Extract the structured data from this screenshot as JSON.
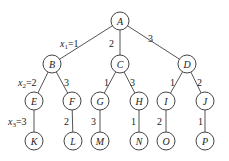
{
  "diagram": {
    "type": "tree",
    "nodes": [
      {
        "id": "A",
        "label": "A",
        "x": 120,
        "y": 21
      },
      {
        "id": "B",
        "label": "B",
        "x": 52,
        "y": 64
      },
      {
        "id": "C",
        "label": "C",
        "x": 120,
        "y": 64
      },
      {
        "id": "D",
        "label": "D",
        "x": 187,
        "y": 64
      },
      {
        "id": "E",
        "label": "E",
        "x": 34,
        "y": 101
      },
      {
        "id": "F",
        "label": "F",
        "x": 72,
        "y": 101
      },
      {
        "id": "G",
        "label": "G",
        "x": 100,
        "y": 101
      },
      {
        "id": "H",
        "label": "H",
        "x": 139,
        "y": 101
      },
      {
        "id": "I",
        "label": "I",
        "x": 166,
        "y": 101
      },
      {
        "id": "J",
        "label": "J",
        "x": 205,
        "y": 101
      },
      {
        "id": "K",
        "label": "K",
        "x": 34,
        "y": 141
      },
      {
        "id": "L",
        "label": "L",
        "x": 73,
        "y": 141
      },
      {
        "id": "M",
        "label": "M",
        "x": 100,
        "y": 141
      },
      {
        "id": "N",
        "label": "N",
        "x": 139,
        "y": 141
      },
      {
        "id": "O",
        "label": "O",
        "x": 166,
        "y": 141
      },
      {
        "id": "P",
        "label": "P",
        "x": 205,
        "y": 141
      }
    ],
    "edges": [
      {
        "from": "A",
        "to": "B",
        "label": "x1=1",
        "main": "x",
        "sub": "1",
        "tail": "=1",
        "lx": 60,
        "ly": 47
      },
      {
        "from": "A",
        "to": "C",
        "label": "2",
        "lx": 109,
        "ly": 47
      },
      {
        "from": "A",
        "to": "D",
        "label": "3",
        "lx": 148,
        "ly": 42
      },
      {
        "from": "B",
        "to": "E",
        "label": "x2=2",
        "main": "x",
        "sub": "2",
        "tail": "=2",
        "lx": 18,
        "ly": 86
      },
      {
        "from": "B",
        "to": "F",
        "label": "3",
        "lx": 64,
        "ly": 86
      },
      {
        "from": "C",
        "to": "G",
        "label": "1",
        "lx": 104,
        "ly": 86
      },
      {
        "from": "C",
        "to": "H",
        "label": "3",
        "lx": 130,
        "ly": 86
      },
      {
        "from": "D",
        "to": "I",
        "label": "1",
        "lx": 170,
        "ly": 86
      },
      {
        "from": "D",
        "to": "J",
        "label": "2",
        "lx": 197,
        "ly": 86
      },
      {
        "from": "E",
        "to": "K",
        "label": "x3=3",
        "main": "x",
        "sub": "3",
        "tail": "=3",
        "lx": 8,
        "ly": 125
      },
      {
        "from": "F",
        "to": "L",
        "label": "2",
        "lx": 64,
        "ly": 125
      },
      {
        "from": "G",
        "to": "M",
        "label": "3",
        "lx": 91,
        "ly": 125
      },
      {
        "from": "H",
        "to": "N",
        "label": "1",
        "lx": 131,
        "ly": 125
      },
      {
        "from": "I",
        "to": "O",
        "label": "2",
        "lx": 157,
        "ly": 125
      },
      {
        "from": "J",
        "to": "P",
        "label": "1",
        "lx": 198,
        "ly": 125
      }
    ],
    "node_radius": 9
  }
}
